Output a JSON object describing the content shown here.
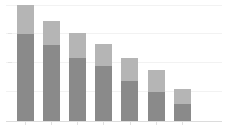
{
  "chart_data": {
    "type": "bar",
    "subtype": "stacked-vertical",
    "title": "",
    "subtitle": "",
    "xlabel": "",
    "ylabel": "",
    "grid": true,
    "legend": false,
    "legend_position": "none",
    "axis_labels_visible": false,
    "tick_labels_visible": false,
    "categories": [
      "1",
      "2",
      "3",
      "4",
      "5",
      "6",
      "7"
    ],
    "xtick_labels": [
      "",
      "",
      "",
      "",
      "",
      "",
      ""
    ],
    "ytick_labels": [],
    "ylim": [
      0,
      120
    ],
    "xlim": [
      0,
      7
    ],
    "series": [
      {
        "name": "lower",
        "color": "#8a8a8a",
        "values": [
          87,
          76,
          63,
          55,
          40,
          29,
          17
        ]
      },
      {
        "name": "upper",
        "color": "#b5b5b5",
        "values": [
          29,
          24,
          25,
          22,
          23,
          22,
          15
        ]
      }
    ],
    "totals": [
      116,
      100,
      88,
      77,
      63,
      51,
      32
    ],
    "annotations": []
  },
  "style": {
    "background": "#ffffff",
    "grid_color": "#f2f2f2",
    "axis_color": "#dcdcdc",
    "tick_color": "#e0e0e0",
    "lower_color": "#8a8a8a",
    "upper_color": "#b5b5b5"
  },
  "geometry": {
    "width": 226,
    "height": 134,
    "baseline_y": 121,
    "plot_left": 17,
    "plot_right": 200,
    "bar_width": 17,
    "bar_pitch": 26,
    "y_scale_px_per_unit": 1.0,
    "gridline_y": [
      5,
      33,
      62,
      91,
      121
    ],
    "bar_left_x": [
      17,
      43,
      69,
      95,
      121,
      148,
      174
    ]
  }
}
